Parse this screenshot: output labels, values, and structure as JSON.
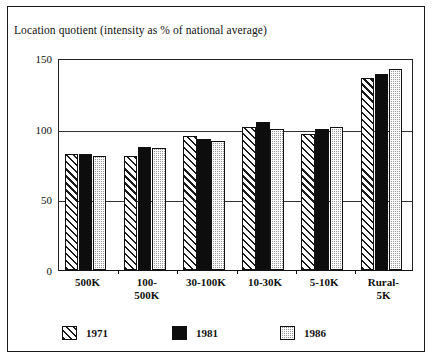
{
  "chart_data": {
    "type": "bar",
    "title": "Location quotient (intensity as % of national average)",
    "xlabel": "",
    "ylabel": "",
    "ylim": [
      0,
      150
    ],
    "yticks": [
      0,
      50,
      100,
      150
    ],
    "grid": true,
    "legend_position": "bottom",
    "categories": [
      "500K",
      "100-500K",
      "30-100K",
      "10-30K",
      "5-10K",
      "Rural-5K"
    ],
    "category_labels_multiline": [
      [
        "500K"
      ],
      [
        "100-",
        "500K"
      ],
      [
        "30-100K"
      ],
      [
        "10-30K"
      ],
      [
        "5-10K"
      ],
      [
        "Rural-",
        "5K"
      ]
    ],
    "series": [
      {
        "name": "1971",
        "pattern": "diagonal-hatch",
        "color": "#f2f2f2",
        "values": [
          82,
          81,
          95,
          101,
          96,
          136
        ]
      },
      {
        "name": "1981",
        "pattern": "solid-black",
        "color": "#0d0d0d",
        "values": [
          82,
          87,
          93,
          105,
          100,
          139
        ]
      },
      {
        "name": "1986",
        "pattern": "dotted-grey",
        "color": "#9a9a9a",
        "values": [
          81,
          86,
          91,
          100,
          101,
          142
        ]
      }
    ]
  },
  "legend": {
    "entries": [
      {
        "label": "1971"
      },
      {
        "label": "1981"
      },
      {
        "label": "1986"
      }
    ]
  },
  "axis": {
    "ytick_labels": [
      "150",
      "100",
      "50",
      "0"
    ]
  }
}
